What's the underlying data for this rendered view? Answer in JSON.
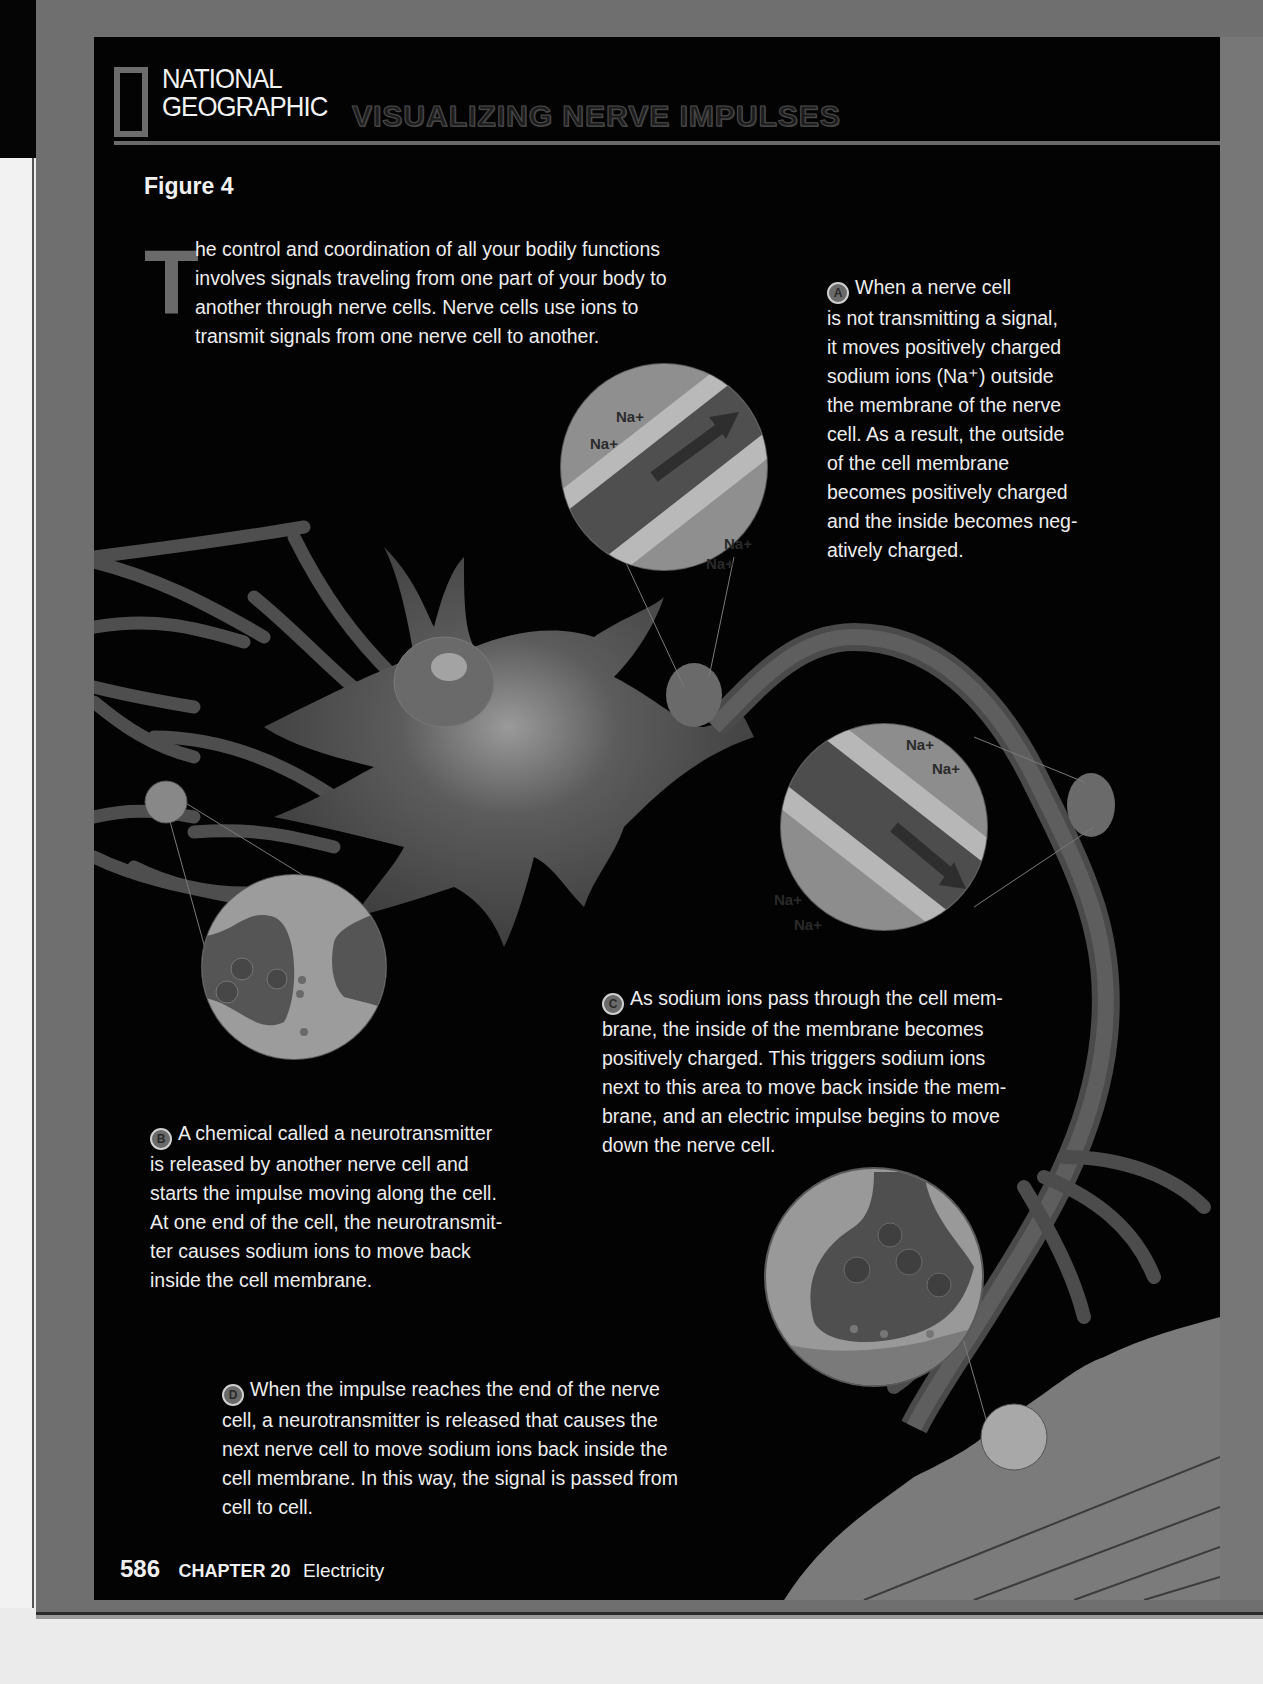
{
  "header": {
    "brand_line1": "NATIONAL",
    "brand_line2": "GEOGRAPHIC",
    "title": "VISUALIZING NERVE IMPULSES",
    "figure_label": "Figure 4"
  },
  "intro": {
    "dropcap": "T",
    "text": "he control and coordination of all your bodily functions\ninvolves signals traveling from one part of your body to\nanother through nerve cells. Nerve cells use ions to\ntransmit signals from one nerve cell to another."
  },
  "callouts": [
    {
      "badge": "A",
      "text": "When a nerve cell\nis not transmitting a signal,\nit moves positively charged\nsodium ions (Na⁺) outside\nthe membrane of the nerve\ncell. As a result, the outside\nof the cell membrane\nbecomes positively charged\nand the inside becomes neg-\natively charged."
    },
    {
      "badge": "B",
      "text": "A chemical called a neurotransmitter\nis released by another nerve cell and\nstarts the impulse moving along the cell.\nAt one end of the cell, the neurotransmit-\nter causes sodium ions to move back\ninside the cell membrane."
    },
    {
      "badge": "C",
      "text": "As sodium ions pass through the cell mem-\nbrane, the inside of the membrane becomes\npositively charged. This triggers sodium ions\nnext to this area to move back inside the mem-\nbrane, and an electric impulse begins to move\ndown the nerve cell."
    },
    {
      "badge": "D",
      "text": "When the impulse reaches the end of the nerve\ncell, a neurotransmitter is released that causes the\nnext nerve cell to move sodium ions back inside the\ncell membrane. In this way, the signal is passed from\ncell to cell."
    }
  ],
  "diagram_labels": {
    "ion": "Na+",
    "plus": "+",
    "minus": "–"
  },
  "footer": {
    "page_number": "586",
    "chapter": "CHAPTER 20",
    "chapter_title": "Electricity"
  },
  "colors": {
    "panel_bg": "#030303",
    "frame": "#6f6f6f",
    "text": "#ededed",
    "accent_gray": "#6a6a6a"
  }
}
